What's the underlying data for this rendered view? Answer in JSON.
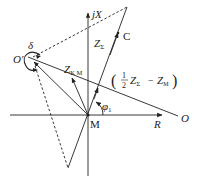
{
  "diagram": {
    "axes": {
      "horizontal_label": "R",
      "vertical_label": "jX",
      "origin_label": "M"
    },
    "points": {
      "o_prime": "O′",
      "o": "O",
      "c": "C"
    },
    "vectors": {
      "z_sigma": {
        "main": "Z",
        "sub": "Σ"
      },
      "z_km": {
        "main": "Z",
        "sub": "K M"
      },
      "expression": {
        "open": "(",
        "num": "1",
        "den": "2",
        "z1": "Z",
        "z1_sub": "Σ",
        "minus": "−",
        "z2": "Z",
        "z2_sub": "M",
        "close": ")"
      }
    },
    "angles": {
      "delta": "δ",
      "phi": "φ",
      "phi_sub": "1"
    },
    "colors": {
      "stroke": "#222222",
      "background": "#ffffff"
    }
  }
}
